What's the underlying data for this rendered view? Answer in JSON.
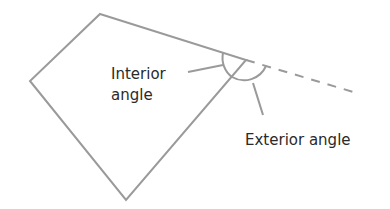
{
  "diagram": {
    "labels": {
      "interior_line1": "Interior",
      "interior_line2": "angle",
      "exterior": "Exterior angle"
    },
    "colors": {
      "stroke": "#9a9a9a",
      "text": "#2a2a2a",
      "background": "#ffffff"
    }
  }
}
